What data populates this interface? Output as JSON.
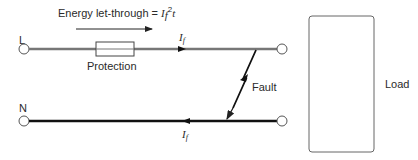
{
  "diagram": {
    "title_annotation": {
      "text_prefix": "Energy let-through = ",
      "symbol": "I",
      "subscript": "f",
      "superscript": "2",
      "suffix": "t"
    },
    "terminals": {
      "line_label": "L",
      "neutral_label": "N"
    },
    "protection_label": "Protection",
    "fault_label": "Fault",
    "load_label": "Load",
    "current_labels": {
      "line": {
        "symbol": "I",
        "subscript": "f"
      },
      "neutral": {
        "symbol": "I",
        "subscript": "f"
      }
    },
    "colors": {
      "line_wire": "#777777",
      "neutral_wire": "#111111",
      "outline": "#555555",
      "text": "#2a2a2a"
    }
  }
}
